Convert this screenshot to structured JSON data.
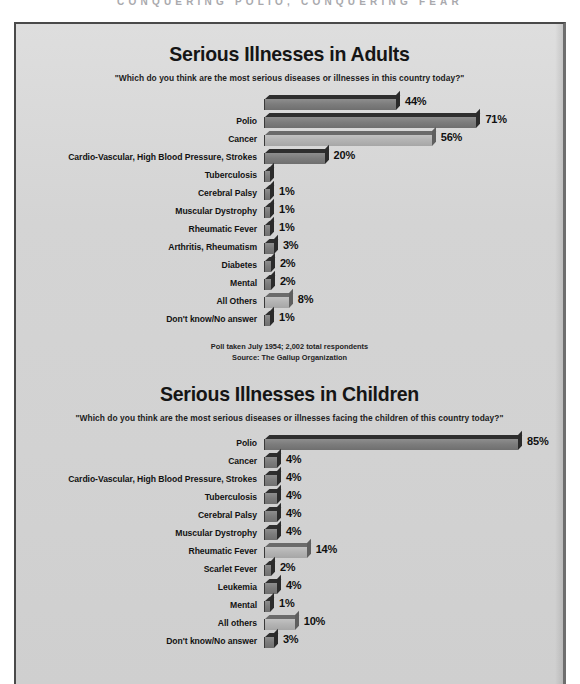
{
  "running_head": "CONQUERING POLIO, CONQUERING FEAR",
  "charts": [
    {
      "title": "Serious Illnesses in Adults",
      "subtitle": "\"Which do you think are the most serious diseases or illnesses in this country today?\"",
      "max_value": 90,
      "rows": [
        {
          "label": "",
          "value": 44,
          "value_label": "44%",
          "style": "dark"
        },
        {
          "label": "Polio",
          "value": 71,
          "value_label": "71%",
          "style": "dark"
        },
        {
          "label": "Cancer",
          "value": 56,
          "value_label": "56%",
          "style": "light"
        },
        {
          "label": "Cardio-Vascular, High Blood Pressure, Strokes",
          "value": 20,
          "value_label": "20%",
          "style": "dark"
        },
        {
          "label": "Tuberculosis",
          "value": 1,
          "value_label": "",
          "style": "dark"
        },
        {
          "label": "Cerebral Palsy",
          "value": 1,
          "value_label": "1%",
          "style": "dark"
        },
        {
          "label": "Muscular Dystrophy",
          "value": 1,
          "value_label": "1%",
          "style": "dark"
        },
        {
          "label": "Rheumatic Fever",
          "value": 1,
          "value_label": "1%",
          "style": "dark"
        },
        {
          "label": "Arthritis, Rheumatism",
          "value": 3,
          "value_label": "3%",
          "style": "dark"
        },
        {
          "label": "Diabetes",
          "value": 2,
          "value_label": "2%",
          "style": "dark"
        },
        {
          "label": "Mental",
          "value": 2,
          "value_label": "2%",
          "style": "dark"
        },
        {
          "label": "All Others",
          "value": 8,
          "value_label": "8%",
          "style": "light"
        },
        {
          "label": "Don't know/No answer",
          "value": 1,
          "value_label": "1%",
          "style": "dark"
        }
      ],
      "source_line_1": "Poll taken July 1954; 2,002 total respondents",
      "source_line_2": "Source: The Gallup Organization"
    },
    {
      "title": "Serious Illnesses in Children",
      "subtitle": "\"Which do you think are the most serious diseases or illnesses facing the children of this country today?\"",
      "max_value": 90,
      "rows": [
        {
          "label": "Polio",
          "value": 85,
          "value_label": "85%",
          "style": "dark"
        },
        {
          "label": "Cancer",
          "value": 4,
          "value_label": "4%",
          "style": "dark"
        },
        {
          "label": "Cardio-Vascular, High Blood Pressure, Strokes",
          "value": 4,
          "value_label": "4%",
          "style": "dark"
        },
        {
          "label": "Tuberculosis",
          "value": 4,
          "value_label": "4%",
          "style": "dark"
        },
        {
          "label": "Cerebral Palsy",
          "value": 4,
          "value_label": "4%",
          "style": "dark"
        },
        {
          "label": "Muscular Dystrophy",
          "value": 4,
          "value_label": "4%",
          "style": "dark"
        },
        {
          "label": "Rheumatic Fever",
          "value": 14,
          "value_label": "14%",
          "style": "light"
        },
        {
          "label": "Scarlet Fever",
          "value": 2,
          "value_label": "2%",
          "style": "dark"
        },
        {
          "label": "Leukemia",
          "value": 4,
          "value_label": "4%",
          "style": "dark"
        },
        {
          "label": "Mental",
          "value": 1,
          "value_label": "1%",
          "style": "dark"
        },
        {
          "label": "All others",
          "value": 10,
          "value_label": "10%",
          "style": "light"
        },
        {
          "label": "Don't know/No answer",
          "value": 3,
          "value_label": "3%",
          "style": "dark"
        }
      ],
      "source_line_1": "",
      "source_line_2": ""
    }
  ],
  "chart_data": [
    {
      "type": "bar",
      "orientation": "horizontal",
      "title": "Serious Illnesses in Adults",
      "subtitle": "\"Which do you think are the most serious diseases or illnesses in this country today?\"",
      "xlabel": "",
      "ylabel": "",
      "xlim": [
        0,
        90
      ],
      "grid": false,
      "legend": "none",
      "value_unit": "percent",
      "categories": [
        "Polio",
        "Cancer",
        "Cardio-Vascular, High Blood Pressure, Strokes",
        "Tuberculosis",
        "Cerebral Palsy",
        "Muscular Dystrophy",
        "Rheumatic Fever",
        "Arthritis, Rheumatism",
        "Diabetes",
        "Mental",
        "All Others",
        "Don't know/No answer"
      ],
      "values": [
        71,
        56,
        44,
        20,
        1,
        1,
        1,
        3,
        2,
        2,
        8,
        1
      ],
      "data_labels": [
        "71%",
        "56%",
        "44%",
        "20%",
        "1%",
        "1%",
        "1%",
        "3%",
        "2%",
        "2%",
        "8%",
        "1%"
      ],
      "annotations": [
        "Poll taken July 1954; 2,002 total respondents",
        "Source: The Gallup Organization"
      ]
    },
    {
      "type": "bar",
      "orientation": "horizontal",
      "title": "Serious Illnesses in Children",
      "subtitle": "\"Which do you think are the most serious diseases or illnesses facing the children of this country today?\"",
      "xlabel": "",
      "ylabel": "",
      "xlim": [
        0,
        90
      ],
      "grid": false,
      "legend": "none",
      "value_unit": "percent",
      "categories": [
        "Polio",
        "Cancer",
        "Cardio-Vascular, High Blood Pressure, Strokes",
        "Tuberculosis",
        "Cerebral Palsy",
        "Muscular Dystrophy",
        "Rheumatic Fever",
        "Scarlet Fever",
        "Leukemia",
        "Mental",
        "All others",
        "Don't know/No answer"
      ],
      "values": [
        85,
        4,
        4,
        4,
        4,
        4,
        14,
        2,
        4,
        1,
        10,
        3
      ],
      "data_labels": [
        "85%",
        "4%",
        "4%",
        "4%",
        "4%",
        "4%",
        "14%",
        "2%",
        "4%",
        "1%",
        "10%",
        "3%"
      ],
      "annotations": []
    }
  ]
}
